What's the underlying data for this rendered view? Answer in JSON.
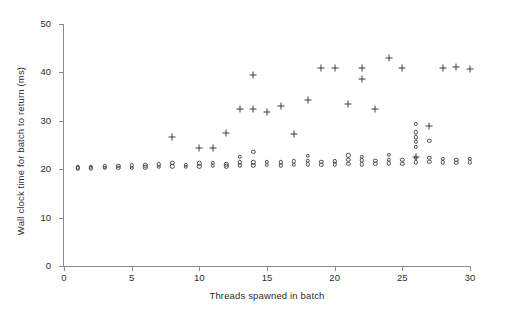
{
  "chart_data": {
    "type": "scatter",
    "title": "",
    "xlabel": "Threads spawned in batch",
    "ylabel": "Wall clock time for batch to return (ms)",
    "xlim": [
      0,
      30
    ],
    "ylim": [
      0,
      50
    ],
    "xticks": [
      0,
      5,
      10,
      15,
      20,
      25,
      30
    ],
    "yticks": [
      0,
      10,
      20,
      30,
      40,
      50
    ],
    "grid": false,
    "legend": false,
    "axis_color": "#8a8a8a",
    "marker_color": "#3d3d3d",
    "series": [
      {
        "name": "circle-markers",
        "marker": "circle",
        "points": [
          [
            1,
            20.2
          ],
          [
            1,
            20.4
          ],
          [
            2,
            20.2
          ],
          [
            2,
            20.5
          ],
          [
            3,
            20.3
          ],
          [
            3,
            20.6
          ],
          [
            4,
            20.3
          ],
          [
            4,
            20.7
          ],
          [
            5,
            20.3
          ],
          [
            5,
            20.8
          ],
          [
            6,
            20.4
          ],
          [
            6,
            20.8
          ],
          [
            7,
            20.5
          ],
          [
            7,
            21.0
          ],
          [
            8,
            20.6
          ],
          [
            8,
            21.3
          ],
          [
            9,
            20.5
          ],
          [
            9,
            20.9
          ],
          [
            10,
            20.6
          ],
          [
            10,
            21.2
          ],
          [
            11,
            20.7
          ],
          [
            11,
            21.3
          ],
          [
            12,
            20.6
          ],
          [
            12,
            21.0
          ],
          [
            13,
            20.8
          ],
          [
            13,
            21.4
          ],
          [
            13,
            22.6
          ],
          [
            14,
            20.8
          ],
          [
            14,
            21.4
          ],
          [
            14,
            23.6
          ],
          [
            15,
            20.9
          ],
          [
            15,
            21.5
          ],
          [
            16,
            20.8
          ],
          [
            16,
            21.4
          ],
          [
            17,
            20.9
          ],
          [
            17,
            21.6
          ],
          [
            18,
            21.0
          ],
          [
            18,
            21.7
          ],
          [
            18,
            22.8
          ],
          [
            19,
            20.9
          ],
          [
            19,
            21.5
          ],
          [
            20,
            21.0
          ],
          [
            20,
            21.6
          ],
          [
            21,
            21.1
          ],
          [
            21,
            21.9
          ],
          [
            21,
            22.9
          ],
          [
            22,
            21.0
          ],
          [
            22,
            21.8
          ],
          [
            22,
            22.5
          ],
          [
            23,
            21.1
          ],
          [
            23,
            21.7
          ],
          [
            24,
            21.2
          ],
          [
            24,
            22.0
          ],
          [
            24,
            23.0
          ],
          [
            25,
            21.1
          ],
          [
            25,
            21.9
          ],
          [
            26,
            21.4
          ],
          [
            26,
            22.4
          ],
          [
            26,
            24.6
          ],
          [
            26,
            25.6
          ],
          [
            26,
            26.6
          ],
          [
            26,
            27.6
          ],
          [
            26,
            29.4
          ],
          [
            27,
            21.5
          ],
          [
            27,
            22.3
          ],
          [
            27,
            25.9
          ],
          [
            28,
            21.4
          ],
          [
            28,
            22.1
          ],
          [
            29,
            21.3
          ],
          [
            29,
            22.0
          ],
          [
            30,
            21.4
          ],
          [
            30,
            22.2
          ]
        ]
      },
      {
        "name": "plus-markers",
        "marker": "plus",
        "points": [
          [
            8,
            26.6
          ],
          [
            10,
            24.4
          ],
          [
            11,
            24.4
          ],
          [
            12,
            27.4
          ],
          [
            13,
            32.4
          ],
          [
            14,
            32.4
          ],
          [
            14,
            39.4
          ],
          [
            15,
            31.8
          ],
          [
            16,
            33.0
          ],
          [
            17,
            27.3
          ],
          [
            18,
            34.3
          ],
          [
            19,
            41.0
          ],
          [
            20,
            41.0
          ],
          [
            21,
            33.5
          ],
          [
            22,
            41.0
          ],
          [
            22,
            38.6
          ],
          [
            23,
            32.4
          ],
          [
            24,
            42.9
          ],
          [
            25,
            41.0
          ],
          [
            26,
            22.6
          ],
          [
            27,
            29.0
          ],
          [
            28,
            41.0
          ],
          [
            29,
            41.2
          ],
          [
            30,
            40.8
          ]
        ]
      }
    ]
  }
}
